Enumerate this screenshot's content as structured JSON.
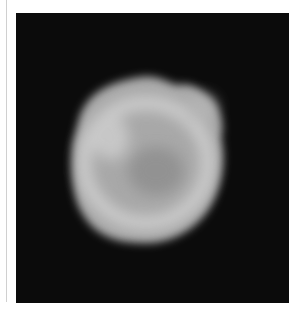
{
  "image": {
    "subject": "grayscale telescope image of a small irregular moon or asteroid against a black sky",
    "background_color": "#0b0b0b",
    "body_color": "#bdbdbd"
  }
}
